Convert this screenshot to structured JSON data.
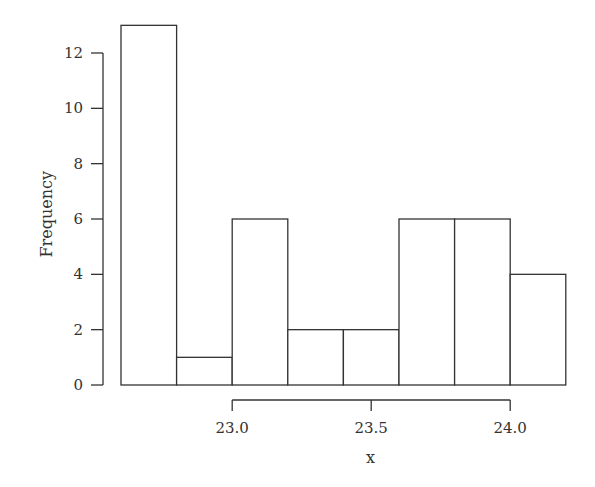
{
  "chart_data": {
    "type": "bar",
    "subtype": "histogram",
    "title": "",
    "xlabel": "x",
    "ylabel": "Frequency",
    "bin_edges": [
      22.6,
      22.8,
      23.0,
      23.2,
      23.4,
      23.6,
      23.8,
      24.0,
      24.2
    ],
    "categories": [
      "22.6-22.8",
      "22.8-23.0",
      "23.0-23.2",
      "23.2-23.4",
      "23.4-23.6",
      "23.6-23.8",
      "23.8-24.0",
      "24.0-24.2"
    ],
    "values": [
      13,
      1,
      6,
      2,
      2,
      6,
      6,
      4
    ],
    "xticks": [
      "23.0",
      "23.5",
      "24.0"
    ],
    "yticks": [
      "0",
      "2",
      "4",
      "6",
      "8",
      "10",
      "12"
    ],
    "ylim": [
      0,
      13
    ],
    "grid": false,
    "legend": null
  }
}
